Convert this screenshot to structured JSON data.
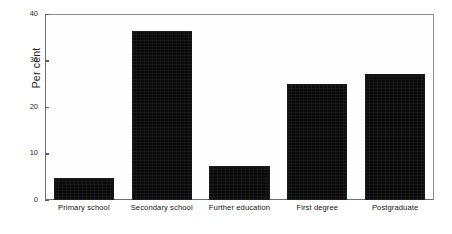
{
  "chart_data": {
    "type": "bar",
    "title": "",
    "xlabel": "",
    "ylabel": "Per cent",
    "categories": [
      "Primary school",
      "Secondary school",
      "Further education",
      "First degree",
      "Postgraduate"
    ],
    "values": [
      4.8,
      36.3,
      7.3,
      24.9,
      27.0
    ],
    "ylim": [
      0,
      40
    ],
    "yticks": [
      0,
      10,
      20,
      30,
      40
    ],
    "ytick_labels": [
      "0",
      "10",
      "20",
      "30",
      "40"
    ],
    "grid": false,
    "legend": null,
    "bar_color": "#0b0b0b",
    "frame_color": "#8d8d8d",
    "background": "#ffffff"
  }
}
